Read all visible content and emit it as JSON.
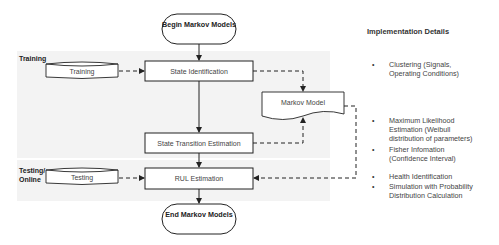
{
  "diagram": {
    "start": "Begin Markov Models",
    "end": "End Markov Models",
    "sections": {
      "training": "Training",
      "testing": "Testing/ Online"
    },
    "data_stores": {
      "training": "Training",
      "testing": "Testing"
    },
    "processes": {
      "state_identification": "State Identification",
      "state_transition": "State Transition Estimation",
      "rul_estimation": "RUL Estimation"
    },
    "document": "Markov Model",
    "colors": {
      "band": "#f3f3f3",
      "stroke": "#222222",
      "fill": "#ffffff"
    }
  },
  "implementation": {
    "title": "Implementation Details",
    "items": [
      {
        "bullet": "•",
        "text_lines": [
          "Clustering (Signals,",
          "Operating Conditions)"
        ]
      },
      {
        "bullet": "•",
        "text_lines": [
          "Maximum Likelihood",
          "Estimation (Weibull",
          "distribution of parameters)"
        ]
      },
      {
        "bullet": "•",
        "text_lines": [
          "Fisher Infomation",
          "(Confidence Interval)"
        ]
      },
      {
        "bullet": "•",
        "text_lines": [
          "Health Identification"
        ]
      },
      {
        "bullet": "•",
        "text_lines": [
          "Simulation with Probability",
          "Distribution Calculation"
        ]
      }
    ]
  }
}
